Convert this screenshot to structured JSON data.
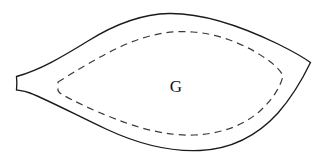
{
  "figure": {
    "background_color": "#ffffff",
    "width": 325,
    "height": 162,
    "label": {
      "text": "G",
      "x": 176,
      "y": 88,
      "font_size": 17,
      "color": "#111111"
    },
    "outer_boundary": {
      "name": "outer-region-boundary",
      "style": "solid",
      "stroke_color": "#1a1a1a",
      "stroke_width": 1.35,
      "fill_color": "#ffffff",
      "path": "M 16.5 76.5 C 40 70 62 57 88 41 C 112 26 140 14 169 13.5 C 205 13 245 28 278 44 C 292 51 303 57 310.5 62.5 C 303 78 292 97 278 113 C 258 135 232 149 200 150.5 C 168 152 136 143 106 129 C 78 116 50 101 30 93 C 25 91 20 90.5 16.5 90 C 17 85.5 17 81 16.5 76.5 Z"
    },
    "inner_boundary": {
      "name": "inner-dashed-contour",
      "style": "dashed",
      "stroke_color": "#3a3a3a",
      "stroke_width": 1.2,
      "dash_length": 7,
      "dash_gap": 5,
      "path": "M 58 82 C 76 71 98 57 122 46 C 146 35 170 30 193 32 C 222 34 250 47 268 60 C 276 66 281 71 283 76 C 280 88 272 100 260 111 C 243 126 220 134 194 135 C 166 136 138 128 113 118 C 92 110 74 101 63 95 C 59 93 57.5 91 58 88.5 C 58.5 86 58.5 84 58 82 Z"
    }
  }
}
